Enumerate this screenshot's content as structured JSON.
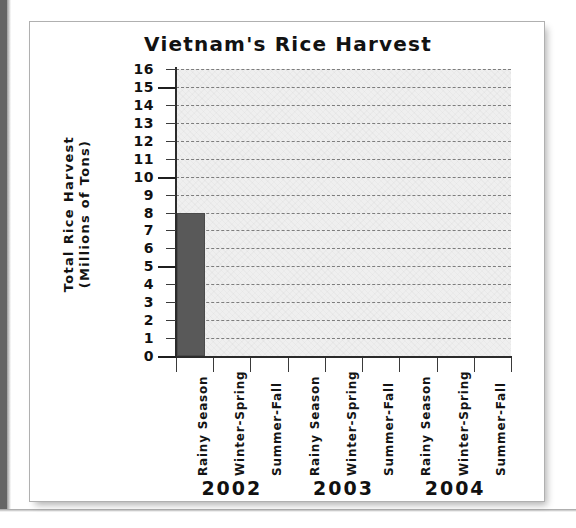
{
  "chart_data": {
    "type": "bar",
    "title": "Vietnam's Rice Harvest",
    "xlabel": "",
    "ylabel_lines": [
      "Total Rice Harvest",
      "(Millions of Tons)"
    ],
    "ylabel": "Total Rice Harvest (Millions of Tons)",
    "ylim": [
      0,
      16
    ],
    "ytick_step": 1,
    "ytick_labels": [
      "16",
      "15",
      "14",
      "13",
      "12",
      "11",
      "10",
      "9",
      "8",
      "7",
      "6",
      "5",
      "4",
      "3",
      "2",
      "1",
      "0"
    ],
    "ymajor_ticks": [
      0,
      5,
      10,
      15
    ],
    "grid": "horizontal-dashed",
    "legend": "none",
    "groups": [
      "2002",
      "2003",
      "2004"
    ],
    "categories": [
      "Rainy Season",
      "Winter-Spring",
      "Summer-Fall",
      "Rainy Season",
      "Winter-Spring",
      "Summer-Fall",
      "Rainy Season",
      "Winter-Spring",
      "Summer-Fall"
    ],
    "season_names": [
      "Rainy Season",
      "Winter-Spring",
      "Summer-Fall"
    ],
    "values": [
      8,
      null,
      null,
      null,
      null,
      null,
      null,
      null,
      null
    ],
    "bars": [
      {
        "group": "2002",
        "season": "Rainy Season",
        "value": 8
      }
    ],
    "bar_color": "#595959",
    "plot_background": "#efefef",
    "gridline_color": "#7d7d7d",
    "axis_color": "#2b2b2b"
  },
  "figure": {
    "title": "Vietnam's Rice Harvest",
    "ylabel_line1": "Total Rice Harvest",
    "ylabel_line2": "(Millions of Tons)",
    "years": [
      {
        "label": "2002"
      },
      {
        "label": "2003"
      },
      {
        "label": "2004"
      }
    ],
    "seasons": [
      {
        "label": "Rainy Season"
      },
      {
        "label": "Winter-Spring"
      },
      {
        "label": "Summer-Fall"
      },
      {
        "label": "Rainy Season"
      },
      {
        "label": "Winter-Spring"
      },
      {
        "label": "Summer-Fall"
      },
      {
        "label": "Rainy Season"
      },
      {
        "label": "Winter-Spring"
      },
      {
        "label": "Summer-Fall"
      }
    ],
    "yticks": [
      {
        "label": "16"
      },
      {
        "label": "15"
      },
      {
        "label": "14"
      },
      {
        "label": "13"
      },
      {
        "label": "12"
      },
      {
        "label": "11"
      },
      {
        "label": "10"
      },
      {
        "label": "9"
      },
      {
        "label": "8"
      },
      {
        "label": "7"
      },
      {
        "label": "6"
      },
      {
        "label": "5"
      },
      {
        "label": "4"
      },
      {
        "label": "3"
      },
      {
        "label": "2"
      },
      {
        "label": "1"
      },
      {
        "label": "0"
      }
    ]
  }
}
